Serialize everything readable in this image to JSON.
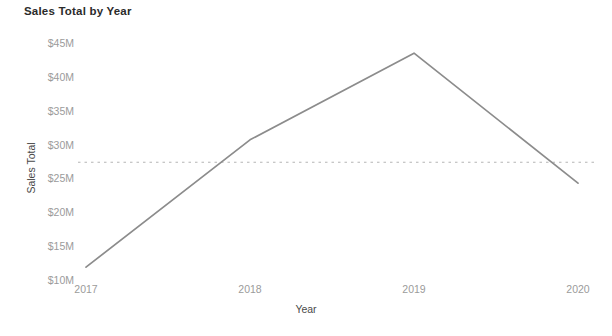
{
  "chart_data": {
    "type": "line",
    "title": "Sales Total by Year",
    "xlabel": "Year",
    "ylabel": "Sales Total",
    "categories": [
      "2017",
      "2018",
      "2019",
      "2020"
    ],
    "x": [
      2017,
      2018,
      2019,
      2020
    ],
    "values": [
      11.9,
      30.7,
      43.5,
      24.3
    ],
    "value_unit": "$M",
    "series": [
      {
        "name": "Sales Total",
        "values": [
          11.9,
          30.7,
          43.5,
          24.3
        ],
        "color": "#8c8c8c"
      }
    ],
    "ylim": [
      10,
      45
    ],
    "xlim": [
      2017,
      2020
    ],
    "ytick_labels": [
      "$45M",
      "$40M",
      "$35M",
      "$30M",
      "$25M",
      "$20M",
      "$15M",
      "$10M"
    ],
    "ytick_values": [
      45,
      40,
      35,
      30,
      25,
      20,
      15,
      10
    ],
    "xtick_labels": [
      "2017",
      "2018",
      "2019",
      "2020"
    ],
    "grid": false,
    "legend": "none",
    "reference_line": {
      "label": "",
      "value": 27.4,
      "style": "dashed",
      "color": "#b5b5b5"
    }
  },
  "axes": {
    "y_title": "Sales Total",
    "x_title": "Year"
  },
  "colors": {
    "line": "#8c8c8c",
    "reference": "#b5b5b5",
    "tick_text": "#9b9b9b",
    "axis_title_text": "#4a4a4a",
    "title_text": "#2b2b2b",
    "background": "#ffffff"
  }
}
